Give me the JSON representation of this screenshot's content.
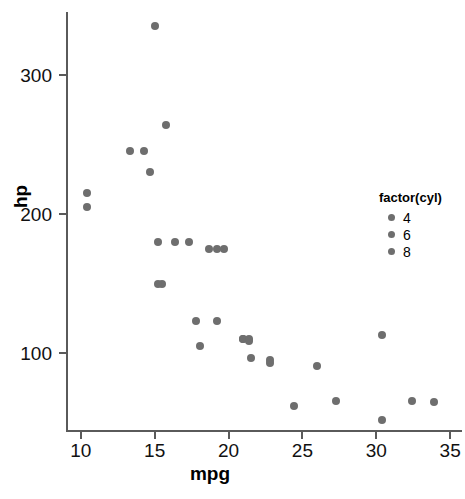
{
  "chart_data": {
    "type": "scatter",
    "title": "",
    "xlabel": "mpg",
    "ylabel": "hp",
    "xlim": [
      9.0,
      35.8
    ],
    "ylim": [
      45,
      345
    ],
    "grid": false,
    "legend_position": "right",
    "legend_title": "factor(cyl)",
    "legend_entries": [
      {
        "label": "4",
        "color": "#6e6e6e"
      },
      {
        "label": "6",
        "color": "#6e6e6e"
      },
      {
        "label": "8",
        "color": "#6e6e6e"
      }
    ],
    "xticks": [
      10,
      15,
      20,
      25,
      30,
      35
    ],
    "xticklabels": [
      "10",
      "15",
      "20",
      "25",
      "30",
      "35"
    ],
    "yticks": [
      100,
      200,
      300
    ],
    "yticklabels": [
      "100",
      "200",
      "300"
    ],
    "point_color": "#6e6e6e",
    "points": [
      {
        "x": 21.0,
        "y": 110,
        "cyl": 6
      },
      {
        "x": 21.0,
        "y": 110,
        "cyl": 6
      },
      {
        "x": 22.8,
        "y": 93,
        "cyl": 4
      },
      {
        "x": 21.4,
        "y": 110,
        "cyl": 6
      },
      {
        "x": 18.7,
        "y": 175,
        "cyl": 8
      },
      {
        "x": 18.1,
        "y": 105,
        "cyl": 6
      },
      {
        "x": 14.3,
        "y": 245,
        "cyl": 8
      },
      {
        "x": 24.4,
        "y": 62,
        "cyl": 4
      },
      {
        "x": 22.8,
        "y": 95,
        "cyl": 4
      },
      {
        "x": 19.2,
        "y": 123,
        "cyl": 6
      },
      {
        "x": 17.8,
        "y": 123,
        "cyl": 6
      },
      {
        "x": 16.4,
        "y": 180,
        "cyl": 8
      },
      {
        "x": 17.3,
        "y": 180,
        "cyl": 8
      },
      {
        "x": 15.2,
        "y": 180,
        "cyl": 8
      },
      {
        "x": 10.4,
        "y": 205,
        "cyl": 8
      },
      {
        "x": 10.4,
        "y": 215,
        "cyl": 8
      },
      {
        "x": 14.7,
        "y": 230,
        "cyl": 8
      },
      {
        "x": 32.4,
        "y": 66,
        "cyl": 4
      },
      {
        "x": 30.4,
        "y": 52,
        "cyl": 4
      },
      {
        "x": 33.9,
        "y": 65,
        "cyl": 4
      },
      {
        "x": 21.5,
        "y": 97,
        "cyl": 4
      },
      {
        "x": 15.5,
        "y": 150,
        "cyl": 8
      },
      {
        "x": 15.2,
        "y": 150,
        "cyl": 8
      },
      {
        "x": 13.3,
        "y": 245,
        "cyl": 8
      },
      {
        "x": 19.2,
        "y": 175,
        "cyl": 8
      },
      {
        "x": 27.3,
        "y": 66,
        "cyl": 4
      },
      {
        "x": 26.0,
        "y": 91,
        "cyl": 4
      },
      {
        "x": 30.4,
        "y": 113,
        "cyl": 4
      },
      {
        "x": 15.8,
        "y": 264,
        "cyl": 8
      },
      {
        "x": 19.7,
        "y": 175,
        "cyl": 6
      },
      {
        "x": 15.0,
        "y": 335,
        "cyl": 8
      },
      {
        "x": 21.4,
        "y": 109,
        "cyl": 4
      }
    ]
  }
}
